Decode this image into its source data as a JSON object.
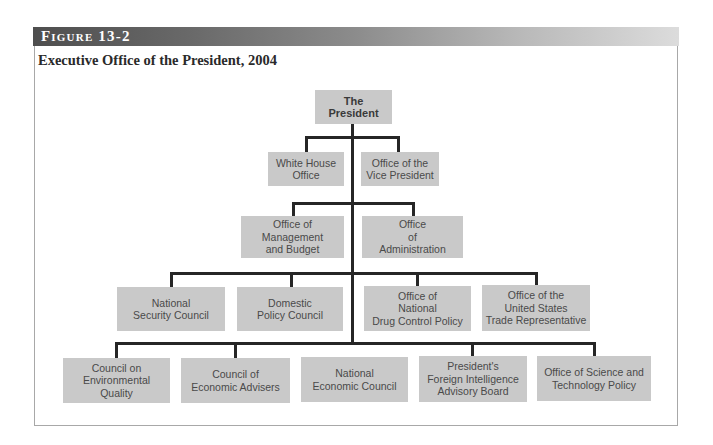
{
  "figure": {
    "label": "Figure 13-2",
    "title": "Executive Office of the President, 2004"
  },
  "chart": {
    "top": {
      "label": "The\nPresident"
    },
    "level1": [
      {
        "label": "White House\nOffice"
      },
      {
        "label": "Office of the\nVice President"
      }
    ],
    "level2": [
      {
        "label": "Office of\nManagement\nand Budget"
      },
      {
        "label": "Office\nof\nAdministration"
      }
    ],
    "level3": [
      {
        "label": "National\nSecurity Council"
      },
      {
        "label": "Domestic\nPolicy Council"
      },
      {
        "label": "Office of\nNational\nDrug Control Policy"
      },
      {
        "label": "Office of the\nUnited States\nTrade Representative"
      }
    ],
    "level4": [
      {
        "label": "Council on\nEnvironmental Quality"
      },
      {
        "label": "Council of\nEconomic Advisers"
      },
      {
        "label": "National\nEconomic Council"
      },
      {
        "label": "President's\nForeign Intelligence\nAdvisory Board"
      },
      {
        "label": "Office of Science and\nTechnology Policy"
      }
    ]
  },
  "colors": {
    "box_fill": "#c9c9c9",
    "connector": "#262626",
    "header_dark": "#4e4e4e",
    "header_light": "#dcdcdc"
  }
}
